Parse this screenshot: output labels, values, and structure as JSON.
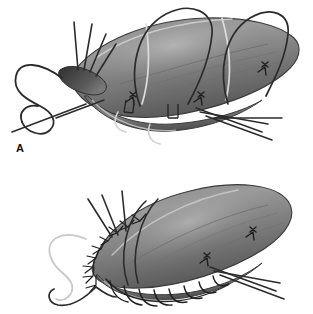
{
  "figure": {
    "kind": "surgical-technique-illustration",
    "background_color": "#ffffff",
    "width": 313,
    "height": 314,
    "panel_count": 2,
    "style": "grayscale airbrush medical illustration"
  },
  "panels": [
    {
      "id": "A",
      "label": "A",
      "label_color": "#111111",
      "caption": "",
      "stage": "sutures placed and held untied; needle with long loose loop at left apex",
      "organ": {
        "name": "tubular-tissue-body",
        "fill_light": "#a0a0a0",
        "fill_mid": "#7c7c7c",
        "fill_dark": "#4e4e4e",
        "outline_color": "#3a3a3a",
        "highlight_color": "#c9c9c9"
      },
      "sutures": {
        "thread_dark_color": "#2b2b2b",
        "thread_light_color": "#d8d8d8",
        "knot_count": 3,
        "free_tail_count": 8,
        "loose_loop_count": 1,
        "encircling_strand_count": 2
      }
    },
    {
      "id": "B",
      "label": "B",
      "label_color": "#111111",
      "caption": "",
      "stage": "sutures tied down; knots seated along the everted suture line",
      "organ": {
        "name": "tubular-tissue-body",
        "fill_light": "#a0a0a0",
        "fill_mid": "#7c7c7c",
        "fill_dark": "#4e4e4e",
        "outline_color": "#3a3a3a",
        "highlight_color": "#c9c9c9"
      },
      "sutures": {
        "thread_dark_color": "#2b2b2b",
        "thread_light_color": "#d8d8d8",
        "knot_count": 9,
        "free_tail_count": 7,
        "loose_loop_count": 1,
        "running_stitch_count": 8
      }
    }
  ],
  "colors": {
    "background": "#ffffff",
    "ink": "#2b2b2b",
    "tissue_light": "#a0a0a0",
    "tissue_mid": "#7c7c7c",
    "tissue_dark": "#4e4e4e",
    "highlight": "#d8d8d8"
  }
}
